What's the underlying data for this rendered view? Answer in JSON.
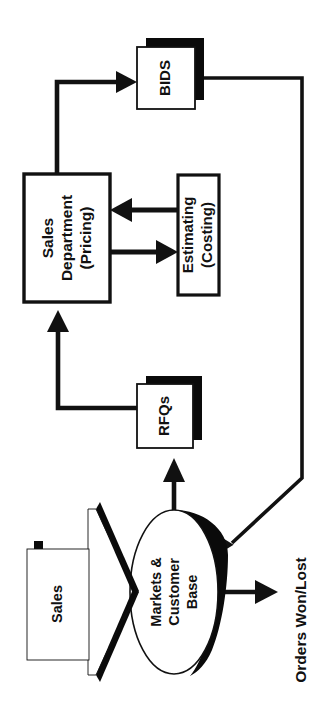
{
  "diagram": {
    "orientation": "rotated-90-ccw",
    "background_color": "#ffffff",
    "line_color": "#111111",
    "shadow_color": "#0a0a0a",
    "fill_color": "#ffffff",
    "nodes": [
      {
        "id": "bids",
        "label": "BIDS",
        "shape": "rectangle-shadowed",
        "icon": "document-box-icon"
      },
      {
        "id": "sales-department",
        "label_line1": "Sales",
        "label_line2": "Department",
        "label_line3": "(Pricing)",
        "label": "Sales Department (Pricing)",
        "shape": "rectangle",
        "icon": "process-box-icon"
      },
      {
        "id": "estimating",
        "label_line1": "Estimating",
        "label_line2": "(Costing)",
        "label": "Estimating (Costing)",
        "shape": "rectangle",
        "icon": "process-box-icon"
      },
      {
        "id": "rfqs",
        "label": "RFQs",
        "shape": "rectangle-shadowed",
        "icon": "document-box-icon"
      },
      {
        "id": "markets-customer-base",
        "label_line1": "Markets &",
        "label_line2": "Customer",
        "label_line3": "Base",
        "label": "Markets & Customer Base",
        "shape": "ellipse-shadowed",
        "icon": "ellipse-node-icon"
      },
      {
        "id": "sales-callout",
        "label": "Sales",
        "shape": "callout-box-shadowed",
        "icon": "callout-box-icon"
      }
    ],
    "edges": [
      {
        "id": "sales-dept-to-bids",
        "from": "sales-department",
        "to": "bids",
        "style": "elbow",
        "arrow": true
      },
      {
        "id": "sales-dept-to-estimating",
        "from": "sales-department",
        "to": "estimating",
        "style": "straight",
        "arrow": true
      },
      {
        "id": "estimating-to-sales-dept",
        "from": "estimating",
        "to": "sales-department",
        "style": "straight",
        "arrow": true
      },
      {
        "id": "rfqs-to-sales-dept",
        "from": "rfqs",
        "to": "sales-department",
        "style": "elbow",
        "arrow": true
      },
      {
        "id": "markets-to-rfqs",
        "from": "markets-customer-base",
        "to": "rfqs",
        "style": "straight",
        "arrow": true
      },
      {
        "id": "bids-to-markets",
        "from": "bids",
        "to": "markets-customer-base",
        "style": "elbow-diagonal",
        "arrow": true
      },
      {
        "id": "markets-to-orders",
        "from": "markets-customer-base",
        "to": "orders-won-lost",
        "style": "straight",
        "arrow": true
      }
    ],
    "annotations": [
      {
        "id": "orders-won-lost",
        "label": "Orders Won/Lost"
      }
    ]
  }
}
